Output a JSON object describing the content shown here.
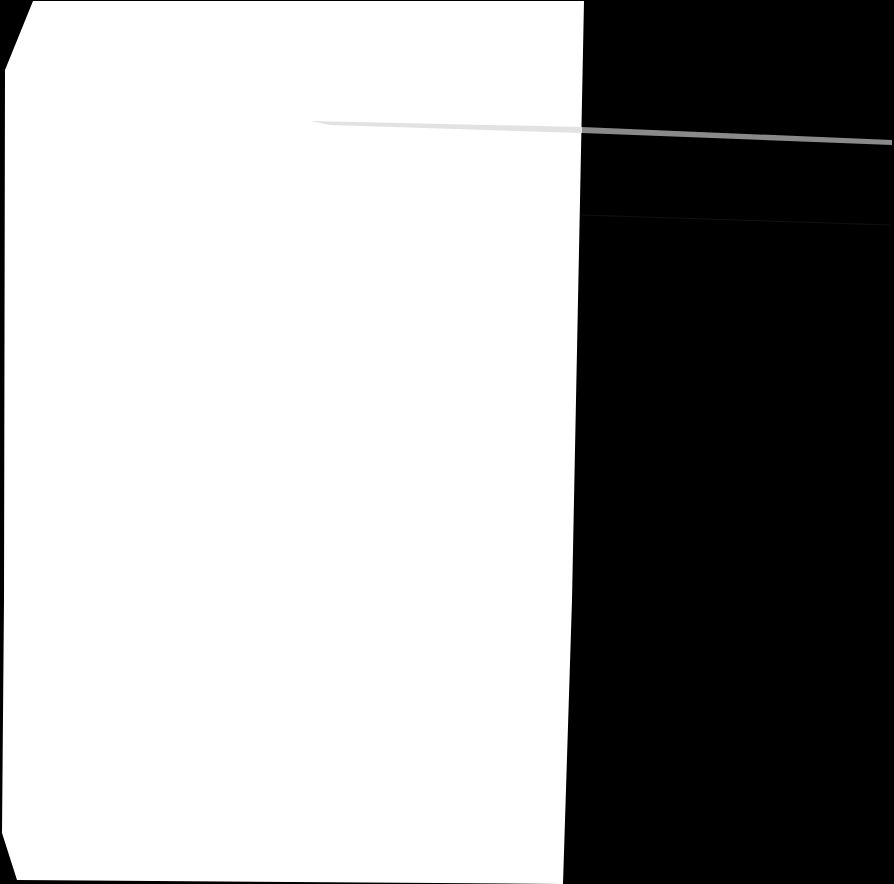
{
  "document": {
    "type": "blank-scanned-page",
    "background_color": "#000000",
    "paper_color": "#ffffff",
    "streak_color": "#8a8a8a"
  }
}
